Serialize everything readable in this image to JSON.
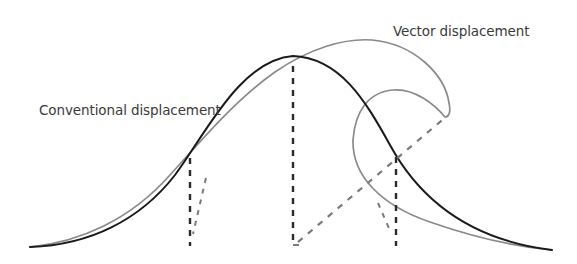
{
  "diagram": {
    "labels": {
      "vector": "Vector displacement",
      "conventional": "Conventional displacement"
    },
    "colors": {
      "base_curve": "#1a1a1a",
      "vector_curve": "#8a8a8a",
      "base_dash": "#2a2a2a",
      "vector_dash": "#7a7a7a",
      "label_text": "#3a3a3a",
      "background": "#ffffff"
    },
    "elements": [
      {
        "name": "base-gaussian-curve",
        "description": "Black bell curve (original surface)"
      },
      {
        "name": "vector-displaced-curve",
        "description": "Gray curve displaced along normals, folding into a wave-like curl"
      },
      {
        "name": "vertical-dashed-lines",
        "count": 3,
        "x": [
          190,
          293,
          396
        ]
      },
      {
        "name": "displacement-vector-dashes",
        "description": "Gray dashed lines showing direction of vector displacement"
      }
    ]
  }
}
